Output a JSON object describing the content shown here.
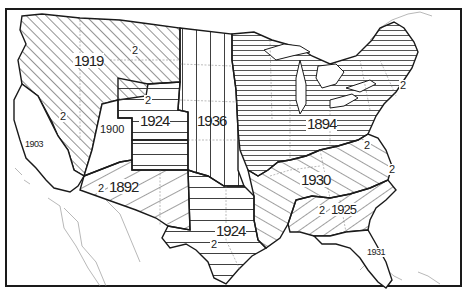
{
  "map": {
    "type": "thematic choropleth (hatched regions)",
    "subject": "United States regions labeled by year",
    "border_color": "#1a1a1a",
    "hatch_color": "#2a2a2a",
    "background": "#ffffff",
    "regions": [
      {
        "id": "northwest",
        "year": "1919",
        "secondary": [
          "2",
          "2"
        ],
        "pattern": "diagonal-dense"
      },
      {
        "id": "california",
        "year": "1903",
        "pattern": "none"
      },
      {
        "id": "nevada",
        "year": "1900",
        "pattern": "none"
      },
      {
        "id": "wyoming-colorado",
        "year": "1924",
        "secondary": [
          "2"
        ],
        "pattern": "horizontal"
      },
      {
        "id": "great-plains",
        "year": "1936",
        "pattern": "vertical"
      },
      {
        "id": "southwest",
        "year": "1892",
        "secondary": [
          "2"
        ],
        "pattern": "diagonal-sparse"
      },
      {
        "id": "texas",
        "year": "1924",
        "secondary": [
          "2"
        ],
        "pattern": "horizontal"
      },
      {
        "id": "northeast-midwest",
        "year": "1894",
        "secondary": [
          "2",
          "2"
        ],
        "pattern": "horizontal-dense"
      },
      {
        "id": "upper-south",
        "year": "1930",
        "secondary": [
          "2"
        ],
        "pattern": "diagonal-up"
      },
      {
        "id": "deep-south",
        "year": "1925",
        "secondary": [
          "2"
        ],
        "pattern": "diagonal-down"
      },
      {
        "id": "florida",
        "year": "1931",
        "pattern": "none"
      }
    ]
  },
  "labels": {
    "northwest_year": "1919",
    "northwest_sub_1": "2",
    "northwest_sub_2": "2",
    "california_year": "1903",
    "nevada_year": "1900",
    "central_rockies_sub": "2",
    "central_rockies_year": "1924",
    "plains_year": "1936",
    "southwest_sub": "2",
    "southwest_year": "1892",
    "texas_year": "1924",
    "texas_sub": "2",
    "northeast_sub_1": "2",
    "midwest_year": "1894",
    "midwest_sub": "2",
    "upper_south_year": "1930",
    "upper_south_sub": "2",
    "deep_south_sub": "2",
    "deep_south_year": "1925",
    "florida_year": "1931"
  }
}
